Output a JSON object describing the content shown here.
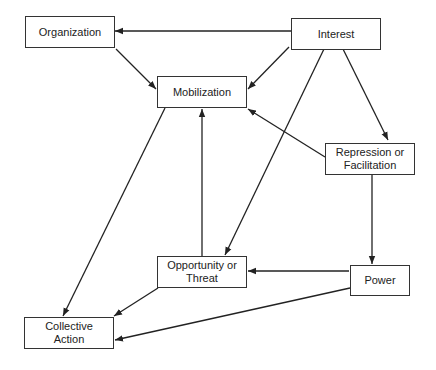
{
  "diagram": {
    "nodes": [
      {
        "id": "organization",
        "label": "Organization",
        "x": 25,
        "y": 16,
        "w": 90,
        "h": 32
      },
      {
        "id": "interest",
        "label": "Interest",
        "x": 291,
        "y": 18,
        "w": 90,
        "h": 32
      },
      {
        "id": "mobilization",
        "label": "Mobilization",
        "x": 157,
        "y": 76,
        "w": 90,
        "h": 32
      },
      {
        "id": "repression",
        "label": "Repression or\nFacilitation",
        "x": 325,
        "y": 143,
        "w": 90,
        "h": 32
      },
      {
        "id": "opportunity",
        "label": "Opportunity or\nThreat",
        "x": 157,
        "y": 256,
        "w": 90,
        "h": 32
      },
      {
        "id": "power",
        "label": "Power",
        "x": 350,
        "y": 265,
        "w": 60,
        "h": 31
      },
      {
        "id": "collective_action",
        "label": "Collective\nAction",
        "x": 24,
        "y": 317,
        "w": 90,
        "h": 32
      }
    ],
    "edges": [
      {
        "from": "interest",
        "to": "organization",
        "x1": 291,
        "y1": 31,
        "x2": 115,
        "y2": 31
      },
      {
        "from": "organization",
        "to": "mobilization",
        "x1": 116,
        "y1": 49,
        "x2": 156,
        "y2": 89
      },
      {
        "from": "interest",
        "to": "mobilization",
        "x1": 289,
        "y1": 47,
        "x2": 248,
        "y2": 89
      },
      {
        "from": "interest",
        "to": "repression",
        "x1": 343,
        "y1": 49,
        "x2": 388,
        "y2": 140
      },
      {
        "from": "interest",
        "to": "opportunity",
        "x1": 324,
        "y1": 49,
        "x2": 225,
        "y2": 255
      },
      {
        "from": "repression",
        "to": "mobilization",
        "x1": 325,
        "y1": 157,
        "x2": 248,
        "y2": 109
      },
      {
        "from": "opportunity",
        "to": "mobilization",
        "x1": 202,
        "y1": 256,
        "x2": 202,
        "y2": 109
      },
      {
        "from": "mobilization",
        "to": "collective_action",
        "x1": 165,
        "y1": 108,
        "x2": 63,
        "y2": 316
      },
      {
        "from": "repression",
        "to": "power",
        "x1": 372,
        "y1": 175,
        "x2": 372,
        "y2": 264
      },
      {
        "from": "power",
        "to": "opportunity",
        "x1": 349,
        "y1": 271,
        "x2": 248,
        "y2": 271
      },
      {
        "from": "opportunity",
        "to": "collective_action",
        "x1": 158,
        "y1": 288,
        "x2": 114,
        "y2": 316
      },
      {
        "from": "power",
        "to": "collective_action",
        "x1": 350,
        "y1": 288,
        "x2": 115,
        "y2": 340
      }
    ]
  }
}
